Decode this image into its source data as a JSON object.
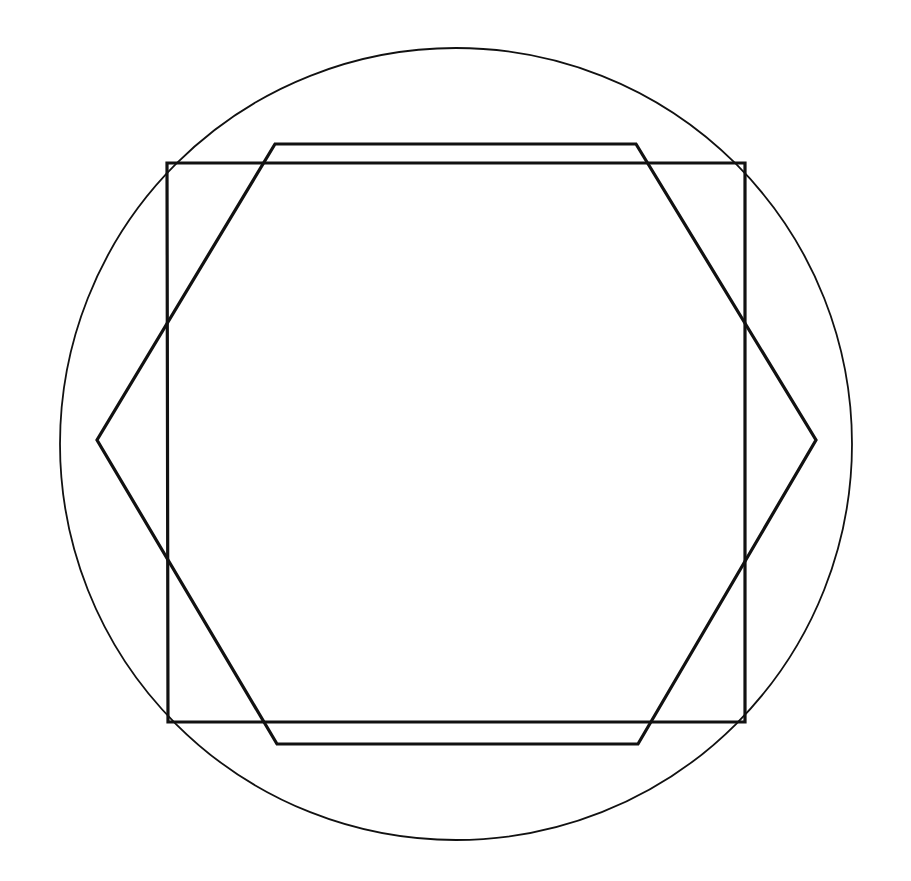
{
  "diagram": {
    "title": "",
    "background": "#ffffff",
    "stroke_color": "#111111",
    "shapes": {
      "circle": {
        "cx": 456,
        "cy": 444,
        "r": 396,
        "stroke_width": 1.8
      },
      "square": {
        "points": "167,163 745,163 745,722 168,722",
        "stroke_width": 3.2
      },
      "hexagon": {
        "points": "275,144 636,144 816,440 638,744 277,744 97,440",
        "stroke_width": 3.2
      }
    }
  }
}
